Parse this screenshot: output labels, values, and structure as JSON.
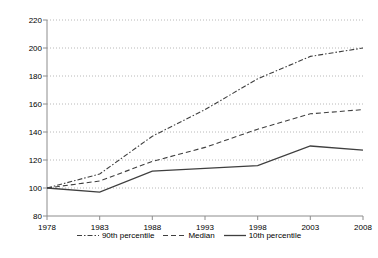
{
  "chart_data": {
    "type": "line",
    "title": "",
    "subtitle": "",
    "xlabel": "",
    "ylabel": "",
    "x": [
      1978,
      1983,
      1988,
      1993,
      1998,
      2003,
      2008
    ],
    "categories": [
      "1978",
      "1983",
      "1988",
      "1993",
      "1998",
      "2003",
      "2008"
    ],
    "xlim": [
      1978,
      2008
    ],
    "ylim": [
      80,
      220
    ],
    "y_ticks": [
      80,
      100,
      120,
      140,
      160,
      180,
      200,
      220
    ],
    "x_ticks": [
      1978,
      1983,
      1988,
      1993,
      1998,
      2003,
      2008
    ],
    "grid": "horizontal-dotted",
    "legend_position": "bottom-center",
    "series": [
      {
        "name": "90th percentile",
        "style": "dash-dot",
        "color": "#3f3f3f",
        "values": [
          100,
          110,
          137,
          156,
          178,
          194,
          200
        ]
      },
      {
        "name": "Median",
        "style": "dashed",
        "color": "#3f3f3f",
        "values": [
          100,
          105,
          119,
          129,
          142,
          153,
          156
        ]
      },
      {
        "name": "10th percentile",
        "style": "solid",
        "color": "#3f3f3f",
        "values": [
          100,
          97,
          112,
          114,
          116,
          130,
          127
        ]
      }
    ]
  },
  "axis": {
    "y_tick_labels": [
      "220",
      "200",
      "180",
      "160",
      "140",
      "120",
      "100",
      "80"
    ],
    "x_tick_labels": [
      "1978",
      "1983",
      "1988",
      "1993",
      "1998",
      "2003",
      "2008"
    ]
  },
  "legend": {
    "items": [
      {
        "label": "90th percentile",
        "style": "dash-dot"
      },
      {
        "label": "Median",
        "style": "dashed"
      },
      {
        "label": "10th percentile",
        "style": "solid"
      }
    ]
  },
  "colors": {
    "line": "#3f3f3f",
    "axis": "#8c8c8c",
    "grid": "#b8b8b8",
    "text": "#000000",
    "background": "#ffffff"
  }
}
